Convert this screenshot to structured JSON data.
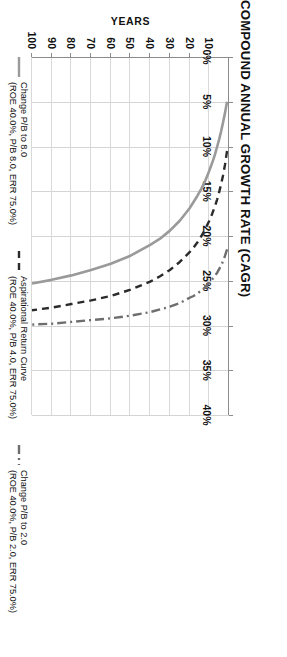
{
  "chart_data": {
    "type": "line",
    "title": "COMPOUND ANNUAL GROWTH RATE (CAGR)",
    "xlabel": "COMPOUND ANNUAL GROWTH RATE (CAGR)",
    "ylabel": "YEARS",
    "orientation": "x-axis across top (CAGR %), y-axis down left (YEARS, inverted)",
    "grid": true,
    "legend_position": "bottom",
    "xlim": [
      0,
      40
    ],
    "ylim": [
      0,
      100
    ],
    "xticks": [
      "0%",
      "5%",
      "10%",
      "15%",
      "20%",
      "25%",
      "30%",
      "35%",
      "40%"
    ],
    "xtick_values": [
      0,
      5,
      10,
      15,
      20,
      25,
      30,
      35,
      40
    ],
    "yticks": [
      "10",
      "20",
      "30",
      "40",
      "50",
      "60",
      "70",
      "80",
      "90",
      "100"
    ],
    "ytick_values": [
      10,
      20,
      30,
      40,
      50,
      60,
      70,
      80,
      90,
      100
    ],
    "x": [
      1,
      2,
      3,
      4,
      5,
      6,
      7,
      8,
      9,
      10,
      12,
      14,
      16,
      18,
      20,
      25,
      30,
      35,
      40,
      50,
      60,
      70,
      80,
      90,
      100
    ],
    "series": [
      {
        "name": "Change P/B to 8.0",
        "detail": "(ROE 40.0%, P/B 8.0, ERR 75.0%)",
        "style": "solid",
        "color": "#9a9a9a",
        "values": [
          5.0,
          6.2,
          7.3,
          8.3,
          9.2,
          10.0,
          10.8,
          11.5,
          12.1,
          12.7,
          13.8,
          14.7,
          15.5,
          16.2,
          16.9,
          18.3,
          19.4,
          20.3,
          21.0,
          22.2,
          23.1,
          23.8,
          24.4,
          24.9,
          25.3
        ]
      },
      {
        "name": "Aspirational Return Curve",
        "detail": "(ROE 40.0%, P/B 4.0, ERR 75.0%)",
        "style": "dashed",
        "color": "#2b2b2b",
        "values": [
          10.5,
          12.0,
          13.2,
          14.2,
          15.1,
          15.9,
          16.6,
          17.2,
          17.8,
          18.3,
          19.2,
          20.0,
          20.7,
          21.3,
          21.8,
          22.9,
          23.8,
          24.5,
          25.1,
          26.0,
          26.7,
          27.2,
          27.6,
          28.0,
          28.3
        ]
      },
      {
        "name": "Change P/B to 2.0",
        "detail": "(ROE 40.0%, P/B 2.0, ERR 75.0%)",
        "style": "dashdot",
        "color": "#6e6e6e",
        "values": [
          21.5,
          22.2,
          22.8,
          23.3,
          23.7,
          24.1,
          24.4,
          24.7,
          25.0,
          25.2,
          25.7,
          26.1,
          26.4,
          26.7,
          26.9,
          27.5,
          27.9,
          28.2,
          28.5,
          28.9,
          29.2,
          29.4,
          29.6,
          29.8,
          29.9
        ]
      }
    ]
  },
  "legend": {
    "items": [
      {
        "label": "Change P/B to 8.0",
        "sub": "(ROE 40.0%, P/B 8.0, ERR 75.0%)",
        "color": "#9a9a9a"
      },
      {
        "label": "Aspirational Return Curve",
        "sub": "(ROE 40.0%, P/B 4.0, ERR 75.0%)",
        "color": "#2b2b2b"
      },
      {
        "label": "Change P/B to 2.0",
        "sub": "(ROE 40.0%, P/B 2.0, ERR 75.0%)",
        "color": "#6e6e6e"
      }
    ]
  }
}
